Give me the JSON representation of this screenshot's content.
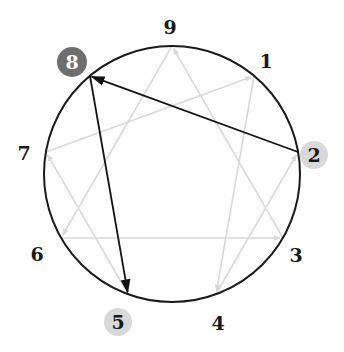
{
  "diagram": {
    "type": "enneagram",
    "circle": {
      "cx": 172,
      "cy": 174,
      "r": 128,
      "stroke": "#1a1a1a"
    },
    "colors": {
      "gray_arrow": "#d9d9d9",
      "black_arrow": "#111111",
      "label_text": "#1a1a1a",
      "badge_dark": "#6e6e6e",
      "badge_dark_text": "#ffffff",
      "badge_light": "#d9d9d9"
    },
    "points": [
      {
        "id": "9",
        "label": "9",
        "x": 172,
        "y": 46,
        "lx": 170,
        "ly": 34,
        "badge": "none"
      },
      {
        "id": "1",
        "label": "1",
        "x": 254,
        "y": 76,
        "lx": 266,
        "ly": 68,
        "badge": "none"
      },
      {
        "id": "2",
        "label": "2",
        "x": 298,
        "y": 152,
        "lx": 314,
        "ly": 162,
        "badge": "light"
      },
      {
        "id": "3",
        "label": "3",
        "x": 283,
        "y": 238,
        "lx": 296,
        "ly": 262,
        "badge": "none"
      },
      {
        "id": "4",
        "label": "4",
        "x": 216,
        "y": 294,
        "lx": 218,
        "ly": 330,
        "badge": "none"
      },
      {
        "id": "5",
        "label": "5",
        "x": 128,
        "y": 294,
        "lx": 118,
        "ly": 329,
        "badge": "light"
      },
      {
        "id": "6",
        "label": "6",
        "x": 61,
        "y": 238,
        "lx": 37,
        "ly": 261,
        "badge": "none"
      },
      {
        "id": "7",
        "label": "7",
        "x": 46,
        "y": 152,
        "lx": 24,
        "ly": 160,
        "badge": "none"
      },
      {
        "id": "8",
        "label": "8",
        "x": 90,
        "y": 76,
        "lx": 72,
        "ly": 69,
        "badge": "dark"
      }
    ],
    "arrows": [
      {
        "from": "6",
        "to": "3",
        "style": "gray"
      },
      {
        "from": "1",
        "to": "4",
        "style": "gray"
      },
      {
        "from": "4",
        "to": "2",
        "style": "gray"
      },
      {
        "from": "7",
        "to": "1",
        "style": "gray"
      },
      {
        "from": "3",
        "to": "9",
        "style": "gray"
      },
      {
        "from": "9",
        "to": "6",
        "style": "gray"
      },
      {
        "from": "5",
        "to": "7",
        "style": "gray"
      },
      {
        "from": "2",
        "to": "8",
        "style": "black"
      },
      {
        "from": "8",
        "to": "5",
        "style": "black"
      }
    ],
    "highlighted": {
      "primary": "8",
      "secondary": [
        "2",
        "5"
      ]
    }
  }
}
